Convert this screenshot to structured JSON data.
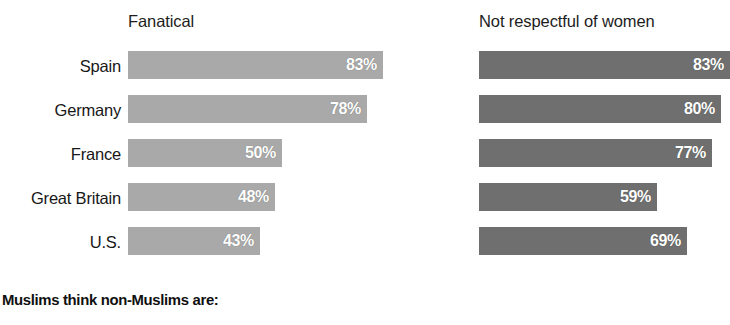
{
  "chart_data": {
    "type": "bar",
    "title": "Muslims think non-Muslims are:",
    "orientation": "horizontal",
    "categories": [
      "Spain",
      "Germany",
      "France",
      "Great Britain",
      "U.S."
    ],
    "series": [
      {
        "name": "Fanatical",
        "values": [
          83,
          78,
          50,
          48,
          43
        ],
        "labels": [
          "83%",
          "78%",
          "50%",
          "48%",
          "43%"
        ],
        "color": "#a9a9a9"
      },
      {
        "name": "Not respectful of women",
        "values": [
          83,
          80,
          77,
          59,
          69
        ],
        "labels": [
          "83%",
          "80%",
          "77%",
          "59%",
          "69%"
        ],
        "color": "#6f6f6f"
      }
    ],
    "xlabel": "",
    "ylabel": "",
    "xlim": [
      0,
      100
    ],
    "grid": false,
    "legend": "none",
    "value_label_position": "inside-end",
    "value_label_color": "#ffffff",
    "background": "#ffffff"
  },
  "headers": {
    "left": "Fanatical",
    "right": "Not respectful of women"
  },
  "caption": "Muslims think non-Muslims are:"
}
